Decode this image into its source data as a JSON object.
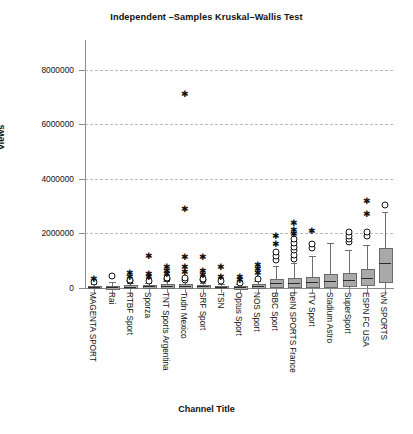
{
  "chart_data": {
    "type": "box",
    "title": "Independent –Samples Kruskal–Wallis Test",
    "xlabel": "Channel Title",
    "ylabel": "Views",
    "ylim": [
      0,
      8500000
    ],
    "yticks": [
      0,
      2000000,
      4000000,
      6000000,
      8000000
    ],
    "ytick_labels": [
      "0",
      "2000000",
      "4000000",
      "6000000",
      "8000000"
    ],
    "grid": "horizontal-dashed",
    "legend": "none",
    "marker_legend": {
      "star": "extreme outlier",
      "circle": "mild outlier"
    },
    "categories": [
      "MAGENTA SPORT",
      "Rai",
      "RTBF Sport",
      "Sporza",
      "TNT Sports Argentina",
      "Tudn Mexico",
      "SRF Sport",
      "TSN",
      "Optus Sport",
      "NOS Sport",
      "BBC Sport",
      "beIN SPORTS France",
      "ITV Sport",
      "Stadium Astro",
      "SuperSport",
      "ESPN FC USA",
      "tvN SPORTS"
    ],
    "boxes": [
      {
        "category": "MAGENTA SPORT",
        "min": 0,
        "q1": 20000,
        "median": 45000,
        "q3": 90000,
        "max": 150000,
        "circles": [
          230000
        ],
        "stars": [
          330000
        ]
      },
      {
        "category": "Rai",
        "min": 0,
        "q1": 15000,
        "median": 35000,
        "q3": 70000,
        "max": 210000,
        "circles": [
          430000
        ],
        "stars": []
      },
      {
        "category": "RTBF Sport",
        "min": 0,
        "q1": 20000,
        "median": 50000,
        "q3": 95000,
        "max": 170000,
        "circles": [
          250000,
          300000
        ],
        "stars": [
          420000,
          560000
        ]
      },
      {
        "category": "Sporza",
        "min": 0,
        "q1": 25000,
        "median": 55000,
        "q3": 100000,
        "max": 180000,
        "circles": [
          240000
        ],
        "stars": [
          390000,
          500000,
          1180000
        ]
      },
      {
        "category": "TNT Sports Argentina",
        "min": 0,
        "q1": 30000,
        "median": 70000,
        "q3": 130000,
        "max": 240000,
        "circles": [
          320000,
          380000
        ],
        "stars": [
          520000,
          640000,
          760000
        ]
      },
      {
        "category": "Tudn Mexico",
        "min": 0,
        "q1": 35000,
        "median": 80000,
        "q3": 150000,
        "max": 260000,
        "circles": [
          300000,
          360000
        ],
        "stars": [
          600000,
          760000,
          1120000,
          2900000,
          7100000
        ]
      },
      {
        "category": "SRF Sport",
        "min": 0,
        "q1": 25000,
        "median": 60000,
        "q3": 110000,
        "max": 200000,
        "circles": [
          280000,
          340000
        ],
        "stars": [
          480000,
          620000,
          1150000
        ]
      },
      {
        "category": "TSN",
        "min": 0,
        "q1": 20000,
        "median": 45000,
        "q3": 85000,
        "max": 160000,
        "circles": [
          250000
        ],
        "stars": [
          420000,
          780000
        ]
      },
      {
        "category": "Optus Sport",
        "min": 0,
        "q1": 15000,
        "median": 35000,
        "q3": 70000,
        "max": 130000,
        "circles": [
          190000
        ],
        "stars": [
          300000,
          420000
        ]
      },
      {
        "category": "NOS Sport",
        "min": 0,
        "q1": 30000,
        "median": 75000,
        "q3": 140000,
        "max": 250000,
        "circles": [
          340000
        ],
        "stars": [
          560000,
          700000,
          840000
        ]
      },
      {
        "category": "BBC Sport",
        "min": 0,
        "q1": 60000,
        "median": 170000,
        "q3": 330000,
        "max": 800000,
        "circles": [
          1020000,
          1180000,
          1320000
        ],
        "stars": [
          1620000,
          1900000
        ]
      },
      {
        "category": "beIN SPORTS France",
        "min": 0,
        "q1": 70000,
        "median": 190000,
        "q3": 380000,
        "max": 900000,
        "circles": [
          1080000,
          1220000,
          1380000,
          1520000,
          1660000,
          1800000
        ],
        "stars": [
          1980000,
          2120000,
          2380000
        ]
      },
      {
        "category": "ITV Sport",
        "min": 0,
        "q1": 80000,
        "median": 210000,
        "q3": 420000,
        "max": 1180000,
        "circles": [
          1480000,
          1620000
        ],
        "stars": [
          2100000
        ]
      },
      {
        "category": "Stadium Astro",
        "min": 0,
        "q1": 90000,
        "median": 260000,
        "q3": 500000,
        "max": 1640000,
        "circles": [],
        "stars": []
      },
      {
        "category": "SuperSport",
        "min": 0,
        "q1": 110000,
        "median": 300000,
        "q3": 560000,
        "max": 1380000,
        "circles": [
          1680000,
          1800000,
          1920000,
          2060000
        ],
        "stars": []
      },
      {
        "category": "ESPN FC USA",
        "min": 0,
        "q1": 140000,
        "median": 380000,
        "q3": 680000,
        "max": 1560000,
        "circles": [
          1900000,
          2040000
        ],
        "stars": [
          2720000,
          3180000
        ]
      },
      {
        "category": "tvN SPORTS",
        "min": 0,
        "q1": 260000,
        "median": 900000,
        "q3": 1480000,
        "max": 2800000,
        "circles": [
          3040000
        ],
        "stars": []
      }
    ]
  }
}
